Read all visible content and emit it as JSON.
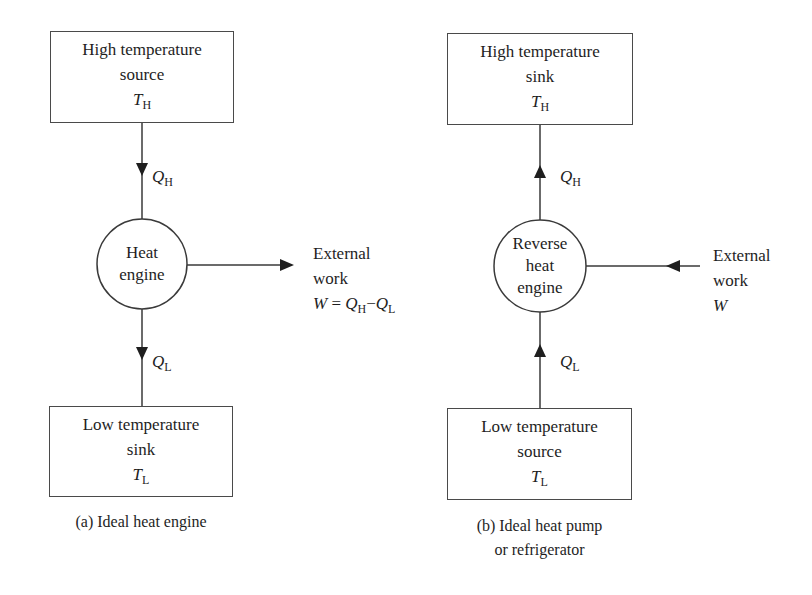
{
  "diagram_a": {
    "top_box": {
      "line1": "High temperature",
      "line2": "source",
      "symbol": "T",
      "symbol_sub": "H"
    },
    "heat_in": {
      "symbol": "Q",
      "symbol_sub": "H"
    },
    "engine": {
      "line1": "Heat",
      "line2": "engine"
    },
    "work": {
      "line1": "External",
      "line2": "work",
      "eq_w": "W",
      "eq_eq": " = ",
      "eq_q1": "Q",
      "eq_q1_sub": "H",
      "eq_minus": "−",
      "eq_q2": "Q",
      "eq_q2_sub": "L"
    },
    "heat_out": {
      "symbol": "Q",
      "symbol_sub": "L"
    },
    "bottom_box": {
      "line1": "Low temperature",
      "line2": "sink",
      "symbol": "T",
      "symbol_sub": "L"
    },
    "caption": "(a) Ideal heat engine"
  },
  "diagram_b": {
    "top_box": {
      "line1": "High temperature",
      "line2": "sink",
      "symbol": "T",
      "symbol_sub": "H"
    },
    "heat_out": {
      "symbol": "Q",
      "symbol_sub": "H"
    },
    "engine": {
      "line1": "Reverse",
      "line2": "heat",
      "line3": "engine"
    },
    "work": {
      "line1": "External",
      "line2": "work",
      "symbol": "W"
    },
    "heat_in": {
      "symbol": "Q",
      "symbol_sub": "L"
    },
    "bottom_box": {
      "line1": "Low temperature",
      "line2": "source",
      "symbol": "T",
      "symbol_sub": "L"
    },
    "caption_line1": "(b) Ideal heat pump",
    "caption_line2": "or refrigerator"
  },
  "colors": {
    "stroke": "#3a3a3a",
    "text": "#1e1e1e",
    "background": "#ffffff"
  }
}
